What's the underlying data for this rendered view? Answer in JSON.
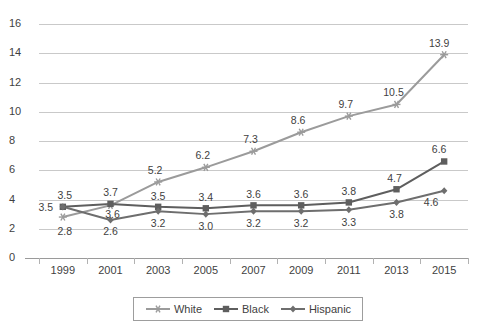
{
  "chart_data": {
    "type": "line",
    "title": "",
    "xlabel": "",
    "ylabel": "",
    "categories": [
      "1999",
      "2001",
      "2003",
      "2005",
      "2007",
      "2009",
      "2011",
      "2013",
      "2015"
    ],
    "ylim": [
      0,
      16
    ],
    "yticks": [
      "0",
      "2",
      "4",
      "6",
      "8",
      "10",
      "12",
      "14",
      "16"
    ],
    "grid": true,
    "legend_position": "bottom",
    "series": [
      {
        "name": "White",
        "marker": "star",
        "color": "#9b9b9b",
        "values": [
          2.8,
          3.6,
          5.2,
          6.2,
          7.3,
          8.6,
          9.7,
          10.5,
          13.9
        ],
        "labels": [
          "2.8",
          "3.6",
          "5.2",
          "6.2",
          "7.3",
          "8.6",
          "9.7",
          "10.5",
          "13.9"
        ]
      },
      {
        "name": "Black",
        "marker": "square",
        "color": "#5e5e5e",
        "values": [
          3.5,
          3.7,
          3.5,
          3.4,
          3.6,
          3.6,
          3.8,
          4.7,
          6.6
        ],
        "labels": [
          "3.5",
          "3.7",
          "3.5",
          "3.4",
          "3.6",
          "3.6",
          "3.8",
          "4.7",
          "6.6"
        ]
      },
      {
        "name": "Hispanic",
        "marker": "diamond",
        "color": "#6e6e6e",
        "values": [
          3.5,
          2.6,
          3.2,
          3.0,
          3.2,
          3.2,
          3.3,
          3.8,
          4.6
        ],
        "labels": [
          "3.5",
          "2.6",
          "3.2",
          "3.0",
          "3.2",
          "3.2",
          "3.3",
          "3.8",
          "4.6"
        ]
      }
    ],
    "point_labels": [
      {
        "text": "3.5",
        "series": "Black",
        "x": 0,
        "dx": -17,
        "dy": 0
      },
      {
        "text": "3.5",
        "series": "Hispanic",
        "x": 0,
        "dx": 2,
        "dy": -12
      },
      {
        "text": "2.8",
        "series": "White",
        "x": 0,
        "dx": 2,
        "dy": 14
      },
      {
        "text": "3.7",
        "series": "Black",
        "x": 1,
        "dx": 0,
        "dy": -12
      },
      {
        "text": "3.6",
        "series": "White",
        "x": 1,
        "dx": 2,
        "dy": 9
      },
      {
        "text": "2.6",
        "series": "Hispanic",
        "x": 1,
        "dx": 0,
        "dy": 11
      },
      {
        "text": "5.2",
        "series": "White",
        "x": 2,
        "dx": -3,
        "dy": -12
      },
      {
        "text": "3.5",
        "series": "Black",
        "x": 2,
        "dx": 0,
        "dy": -11
      },
      {
        "text": "3.2",
        "series": "Hispanic",
        "x": 2,
        "dx": 0,
        "dy": 12
      },
      {
        "text": "6.2",
        "series": "White",
        "x": 3,
        "dx": -3,
        "dy": -12
      },
      {
        "text": "3.4",
        "series": "Black",
        "x": 3,
        "dx": 0,
        "dy": -11
      },
      {
        "text": "3.0",
        "series": "Hispanic",
        "x": 3,
        "dx": 0,
        "dy": 12
      },
      {
        "text": "7.3",
        "series": "White",
        "x": 4,
        "dx": -3,
        "dy": -12
      },
      {
        "text": "3.6",
        "series": "Black",
        "x": 4,
        "dx": 0,
        "dy": -11
      },
      {
        "text": "3.2",
        "series": "Hispanic",
        "x": 4,
        "dx": 0,
        "dy": 12
      },
      {
        "text": "8.6",
        "series": "White",
        "x": 5,
        "dx": -3,
        "dy": -12
      },
      {
        "text": "3.6",
        "series": "Black",
        "x": 5,
        "dx": 0,
        "dy": -11
      },
      {
        "text": "3.2",
        "series": "Hispanic",
        "x": 5,
        "dx": 0,
        "dy": 12
      },
      {
        "text": "9.7",
        "series": "White",
        "x": 6,
        "dx": -3,
        "dy": -12
      },
      {
        "text": "3.8",
        "series": "Black",
        "x": 6,
        "dx": 0,
        "dy": -11
      },
      {
        "text": "3.3",
        "series": "Hispanic",
        "x": 6,
        "dx": 0,
        "dy": 12
      },
      {
        "text": "10.5",
        "series": "White",
        "x": 7,
        "dx": -3,
        "dy": -12
      },
      {
        "text": "4.7",
        "series": "Black",
        "x": 7,
        "dx": -2,
        "dy": -11
      },
      {
        "text": "3.8",
        "series": "Hispanic",
        "x": 7,
        "dx": 0,
        "dy": 12
      },
      {
        "text": "13.9",
        "series": "White",
        "x": 8,
        "dx": -5,
        "dy": -12
      },
      {
        "text": "6.6",
        "series": "Black",
        "x": 8,
        "dx": -5,
        "dy": -12
      },
      {
        "text": "4.6",
        "series": "Hispanic",
        "x": 8,
        "dx": -13,
        "dy": 11
      }
    ]
  },
  "legend": {
    "items": [
      {
        "label": "White"
      },
      {
        "label": "Black"
      },
      {
        "label": "Hispanic"
      }
    ]
  }
}
